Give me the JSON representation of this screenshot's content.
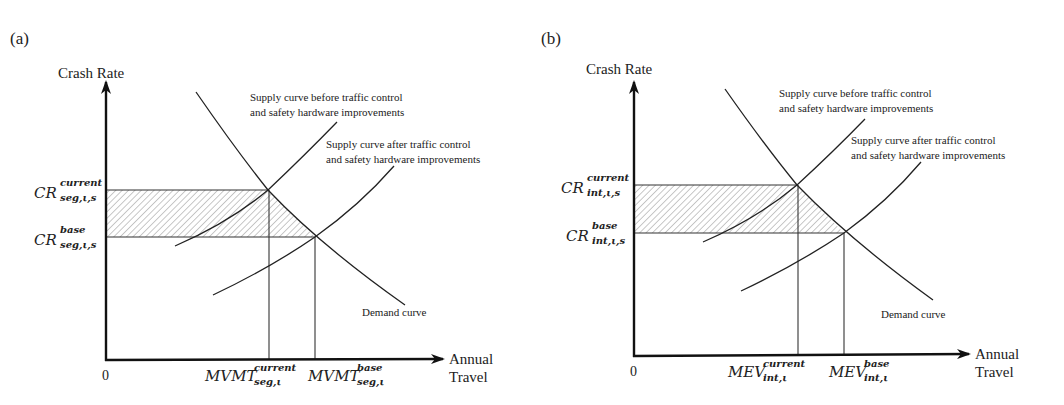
{
  "figure": {
    "panels": [
      {
        "id": "a",
        "panel_label": "(a)",
        "y_axis_label": "Crash Rate",
        "x_axis_label_line1": "Annual",
        "x_axis_label_line2": "Travel",
        "origin_label": "0",
        "y_levels": {
          "current": {
            "base": "CR",
            "sup": "current",
            "sub": "seg,ι,s"
          },
          "base": {
            "base": "CR",
            "sup": "base",
            "sub": "seg,ι,s"
          }
        },
        "x_levels": {
          "current": {
            "base": "MVMT",
            "sup": "current",
            "sub": "seg,ι"
          },
          "base": {
            "base": "MVMT",
            "sup": "base",
            "sub": "seg,ι"
          }
        },
        "annotations": {
          "supply_before_line1": "Supply curve before traffic control",
          "supply_before_line2": "and safety hardware improvements",
          "supply_after_line1": "Supply curve after traffic control",
          "supply_after_line2": "and safety hardware improvements",
          "demand": "Demand curve"
        }
      },
      {
        "id": "b",
        "panel_label": "(b)",
        "y_axis_label": "Crash Rate",
        "x_axis_label_line1": "Annual",
        "x_axis_label_line2": "Travel",
        "origin_label": "0",
        "y_levels": {
          "current": {
            "base": "CR",
            "sup": "current",
            "sub": "int,ι,s"
          },
          "base": {
            "base": "CR",
            "sup": "base",
            "sub": "int,ι,s"
          }
        },
        "x_levels": {
          "current": {
            "base": "MEV",
            "sup": "current",
            "sub": "int,ι"
          },
          "base": {
            "base": "MEV",
            "sup": "base",
            "sub": "int,ι"
          }
        },
        "annotations": {
          "supply_before_line1": "Supply curve before traffic control",
          "supply_before_line2": "and safety hardware improvements",
          "supply_after_line1": "Supply curve after traffic control",
          "supply_after_line2": "and safety hardware improvements",
          "demand": "Demand curve"
        }
      }
    ],
    "colors": {
      "line": "#222222",
      "hatch": "#9a9a9a",
      "background": "#ffffff"
    }
  }
}
